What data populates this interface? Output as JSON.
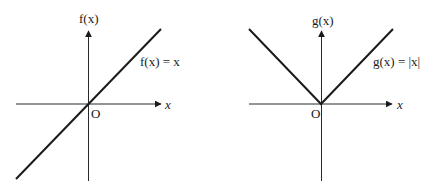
{
  "figures": [
    {
      "id": "left",
      "y_axis_label": "f(x)",
      "x_axis_label": "x",
      "origin_label": "O",
      "function_label": "f(x) = x",
      "function": "identity",
      "geometry": {
        "origin": [
          88,
          104
        ],
        "x_axis": [
          16,
          160
        ],
        "y_axis": [
          181,
          33
        ],
        "curve_points": [
          [
            16,
            179
          ],
          [
            161,
            29
          ]
        ]
      }
    },
    {
      "id": "right",
      "y_axis_label": "g(x)",
      "x_axis_label": "x",
      "origin_label": "O",
      "function_label": "g(x) = |x|",
      "function": "absolute value",
      "geometry": {
        "origin": [
          321,
          104
        ],
        "x_axis": [
          249,
          391
        ],
        "y_axis": [
          181,
          33
        ],
        "curve_points": [
          [
            249,
            29
          ],
          [
            321,
            104
          ],
          [
            393,
            29
          ]
        ]
      }
    }
  ],
  "colors": {
    "line": "#1a1a1a",
    "axis": "#2a2a2a",
    "background": "#ffffff"
  }
}
